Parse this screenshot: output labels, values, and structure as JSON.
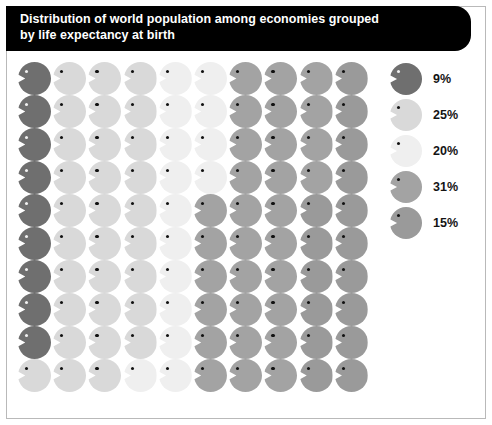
{
  "title": {
    "line1": "Distribution of world population among economies grouped",
    "line2": "by life expectancy at birth",
    "full": "Distribution of world population among economies grouped\nby life expectancy at birth"
  },
  "chart_data": {
    "type": "pictogram",
    "title": "Distribution of world population among economies grouped by life expectancy at birth",
    "xlabel": "",
    "ylabel": "",
    "unit": "1 icon = 1% of world population",
    "total_icons": 100,
    "grid": {
      "rows": 10,
      "columns": 10,
      "fill_order": "column-major-top-to-bottom"
    },
    "categories": [
      "9%",
      "25%",
      "20%",
      "31%",
      "15%"
    ],
    "values": [
      9,
      25,
      20,
      31,
      15
    ],
    "colors": [
      "#6f6f6f",
      "#d9d9d9",
      "#efefef",
      "#a3a3a3",
      "#9a9a9a"
    ],
    "legend": {
      "position": "right",
      "entries": [
        {
          "label": "9%",
          "value": 9,
          "color": "#6f6f6f",
          "icon": "person-icon"
        },
        {
          "label": "25%",
          "value": 25,
          "color": "#d9d9d9",
          "icon": "person-icon"
        },
        {
          "label": "20%",
          "value": 20,
          "color": "#efefef",
          "icon": "person-icon"
        },
        {
          "label": "31%",
          "value": 31,
          "color": "#a3a3a3",
          "icon": "person-icon"
        },
        {
          "label": "15%",
          "value": 15,
          "color": "#9a9a9a",
          "icon": "person-icon"
        }
      ]
    },
    "icon_colors_by_row": [
      [
        "#6f6f6f",
        "#d9d9d9",
        "#d9d9d9",
        "#d9d9d9",
        "#efefef",
        "#efefef",
        "#a3a3a3",
        "#a3a3a3",
        "#a3a3a3",
        "#9a9a9a"
      ],
      [
        "#6f6f6f",
        "#d9d9d9",
        "#d9d9d9",
        "#d9d9d9",
        "#efefef",
        "#efefef",
        "#a3a3a3",
        "#a3a3a3",
        "#a3a3a3",
        "#9a9a9a"
      ],
      [
        "#6f6f6f",
        "#d9d9d9",
        "#d9d9d9",
        "#d9d9d9",
        "#efefef",
        "#efefef",
        "#a3a3a3",
        "#a3a3a3",
        "#a3a3a3",
        "#9a9a9a"
      ],
      [
        "#6f6f6f",
        "#d9d9d9",
        "#d9d9d9",
        "#d9d9d9",
        "#efefef",
        "#efefef",
        "#a3a3a3",
        "#a3a3a3",
        "#a3a3a3",
        "#9a9a9a"
      ],
      [
        "#6f6f6f",
        "#d9d9d9",
        "#d9d9d9",
        "#d9d9d9",
        "#efefef",
        "#a3a3a3",
        "#a3a3a3",
        "#a3a3a3",
        "#9a9a9a",
        "#9a9a9a"
      ],
      [
        "#6f6f6f",
        "#d9d9d9",
        "#d9d9d9",
        "#d9d9d9",
        "#efefef",
        "#a3a3a3",
        "#a3a3a3",
        "#a3a3a3",
        "#9a9a9a",
        "#9a9a9a"
      ],
      [
        "#6f6f6f",
        "#d9d9d9",
        "#d9d9d9",
        "#d9d9d9",
        "#efefef",
        "#a3a3a3",
        "#a3a3a3",
        "#a3a3a3",
        "#9a9a9a",
        "#9a9a9a"
      ],
      [
        "#6f6f6f",
        "#d9d9d9",
        "#d9d9d9",
        "#d9d9d9",
        "#efefef",
        "#a3a3a3",
        "#a3a3a3",
        "#a3a3a3",
        "#9a9a9a",
        "#9a9a9a"
      ],
      [
        "#6f6f6f",
        "#d9d9d9",
        "#d9d9d9",
        "#d9d9d9",
        "#efefef",
        "#a3a3a3",
        "#a3a3a3",
        "#a3a3a3",
        "#9a9a9a",
        "#9a9a9a"
      ],
      [
        "#d9d9d9",
        "#d9d9d9",
        "#d9d9d9",
        "#efefef",
        "#efefef",
        "#a3a3a3",
        "#a3a3a3",
        "#a3a3a3",
        "#9a9a9a",
        "#9a9a9a"
      ]
    ],
    "dark_icon_color": "#6f6f6f"
  },
  "style": {
    "banner_bg": "#000000",
    "banner_fg": "#ffffff",
    "canvas_bg": "#ffffff",
    "frame_border": "#b9b9b9"
  }
}
